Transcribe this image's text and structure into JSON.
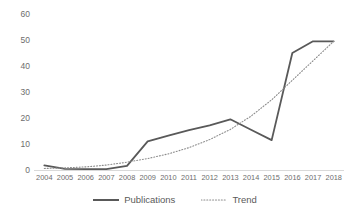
{
  "chart_data": {
    "type": "line",
    "title": "",
    "subtitle": "",
    "xlabel": "",
    "ylabel": "",
    "categories": [
      "2004",
      "2005",
      "2006",
      "2007",
      "2008",
      "2009",
      "2010",
      "2011",
      "2012",
      "2013",
      "2014",
      "2015",
      "2016",
      "2017",
      "2018"
    ],
    "series": [
      {
        "name": "Publications",
        "style": "solid",
        "color": "#595959",
        "values": [
          1.8,
          0.4,
          0.3,
          0.3,
          1.6,
          11.0,
          13.2,
          15.3,
          17.2,
          19.5,
          15.5,
          11.5,
          45.0,
          49.5,
          49.5
        ]
      },
      {
        "name": "Trend",
        "style": "dotted",
        "color": "#8c8c8c",
        "values": [
          0.6,
          0.8,
          1.2,
          1.9,
          3.0,
          4.4,
          6.2,
          8.6,
          11.7,
          15.6,
          20.7,
          27.0,
          34.5,
          42.0,
          49.5
        ]
      }
    ],
    "yticks": [
      0,
      10,
      20,
      30,
      40,
      50,
      60
    ],
    "ylim": [
      0,
      60
    ],
    "grid": false,
    "legend_position": "bottom-center",
    "axis_color": "#d9d9d9",
    "tick_label_color": "#6d6d6d"
  },
  "legend": {
    "items": [
      {
        "label": "Publications",
        "style": "solid"
      },
      {
        "label": "Trend",
        "style": "dotted"
      }
    ]
  }
}
